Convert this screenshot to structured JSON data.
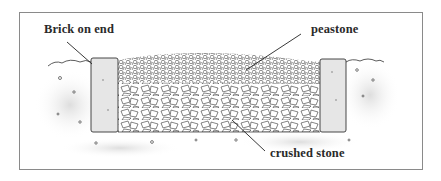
{
  "figure": {
    "labels": {
      "brick": "Brick on end",
      "peastone": "peastone",
      "crushed_stone": "crushed stone"
    },
    "colors": {
      "ink": "#2a2a2a",
      "frame": "#8a8a8a",
      "brick_fill": "#e6e6e6",
      "soil_shade": "#d9d9d9"
    }
  }
}
